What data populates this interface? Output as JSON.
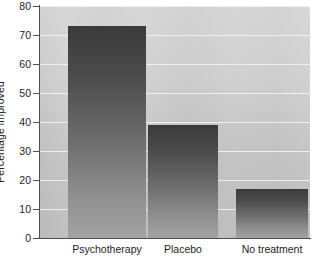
{
  "chart_data": {
    "type": "bar",
    "title": "",
    "subtitle": "",
    "xlabel": "",
    "ylabel": "Percentage improved",
    "categories": [
      "Psychotherapy",
      "Placebo",
      "No treatment"
    ],
    "values": [
      73,
      39,
      17
    ],
    "ylim": [
      0,
      80
    ],
    "y_ticks": [
      0,
      10,
      20,
      30,
      40,
      50,
      60,
      70,
      80
    ],
    "y_tick_labels": [
      "0",
      "10",
      "20",
      "30",
      "40",
      "50",
      "60",
      "70",
      "80"
    ],
    "grid": true,
    "grid_axis": "y",
    "legend": false,
    "legend_position": "none",
    "series": [
      {
        "name": "Percentage improved",
        "values": [
          73,
          39,
          17
        ]
      }
    ],
    "colors": {
      "bar_top": "#3b3b3b",
      "bar_bottom": "#a3a3a3",
      "plot_background": "#d2d2d2",
      "gridline": "#f2f2f2",
      "axis": "#4f4f4f",
      "text": "#1d1d1d",
      "page_background": "#ffffff"
    }
  }
}
